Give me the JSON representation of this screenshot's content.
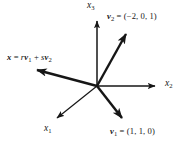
{
  "figure": {
    "kind": "vector-diagram",
    "width": 187,
    "height": 143,
    "background_color": "#ffffff",
    "ink_color": "#161616"
  },
  "axes": {
    "origin": {
      "x": 97,
      "y": 86
    },
    "items": [
      {
        "id": "x3",
        "label_plain": "x3",
        "label_base": "x",
        "label_sub": "3",
        "direction": "up",
        "tip": {
          "x": 97,
          "y": 16
        },
        "arrowhead": true
      },
      {
        "id": "x2",
        "label_plain": "x2",
        "label_base": "x",
        "label_sub": "2",
        "direction": "right",
        "tip": {
          "x": 161,
          "y": 86
        },
        "arrowhead": true
      },
      {
        "id": "x1",
        "label_plain": "x1",
        "label_base": "x",
        "label_sub": "1",
        "direction": "down-left",
        "tip": {
          "x": 53,
          "y": 121
        },
        "arrowhead": true
      }
    ]
  },
  "vectors": [
    {
      "id": "v2",
      "name_base": "v",
      "name_sub": "2",
      "equals": "=",
      "components": "(−2, 0, 1)",
      "label_plain": "v2 = (−2, 0, 1)",
      "tip": {
        "x": 132,
        "y": 28
      },
      "arrowhead": true
    },
    {
      "id": "v1",
      "name_base": "v",
      "name_sub": "1",
      "equals": "=",
      "components": "(1, 1, 0)",
      "label_plain": "v1 = (1, 1, 0)",
      "tip": {
        "x": 128,
        "y": 124
      },
      "arrowhead": true
    },
    {
      "id": "x",
      "name_base": "x",
      "name_sub": "",
      "equals": "=",
      "components": "rv1 + sv2",
      "label_plain": "x = rv1 + sv2",
      "expr": {
        "lhs": "x",
        "eq": "=",
        "coef1": "r",
        "vec1_base": "v",
        "vec1_sub": "1",
        "plus": "+",
        "coef2": "s",
        "vec2_base": "v",
        "vec2_sub": "2"
      },
      "tip": {
        "x": 29,
        "y": 67
      },
      "arrowhead": true
    }
  ]
}
